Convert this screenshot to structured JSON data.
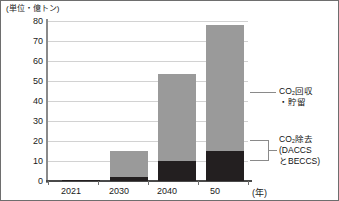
{
  "chart_data": {
    "type": "bar",
    "stacked": true,
    "title": "",
    "subtitle": "",
    "unit_caption": "(単位・億トン)",
    "xlabel": "(年)",
    "ylabel": "",
    "categories": [
      "2021",
      "2030",
      "2040",
      "50"
    ],
    "ylim": [
      0,
      80
    ],
    "ytick_labels": [
      "0",
      "10",
      "20",
      "30",
      "40",
      "50",
      "60",
      "70",
      "80"
    ],
    "ytick_values": [
      0,
      10,
      20,
      30,
      40,
      50,
      60,
      70,
      80
    ],
    "grid": true,
    "legend_position": "right",
    "series": [
      {
        "name": "CO₂除去（DACCSとBECCS）",
        "name_line1": "CO₂除去",
        "name_line2": "(DACCS",
        "name_line3": "とBECCS)",
        "color": "#231f20",
        "values": [
          0.3,
          2.0,
          10.0,
          15.0
        ]
      },
      {
        "name": "CO₂回収・貯留",
        "name_line1": "CO₂回収",
        "name_line2": "・貯留",
        "color": "#9a9a9a",
        "values": [
          0.2,
          13.0,
          43.5,
          63.0
        ]
      }
    ],
    "totals": [
      0.5,
      15.0,
      53.5,
      78.0
    ]
  },
  "legend": {
    "items": [
      {
        "key": "ccs",
        "line1": "CO₂回収",
        "line2": "・貯留",
        "swatch_color": "#9a9a9a"
      },
      {
        "key": "cdr",
        "line1": "CO₂除去",
        "line2": "(DACCS",
        "line3": "とBECCS)",
        "swatch_color": "#231f20"
      }
    ]
  },
  "axis": {
    "y_labels": [
      "80",
      "70",
      "60",
      "50",
      "40",
      "30",
      "20",
      "10",
      "0"
    ],
    "x_labels": [
      "2021",
      "2030",
      "2040",
      "50"
    ],
    "x_unit": "(年)"
  }
}
